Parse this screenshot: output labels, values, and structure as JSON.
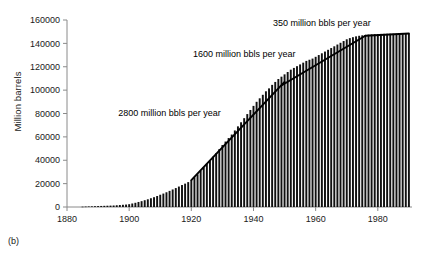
{
  "figure": {
    "caption": "(b)",
    "ylabel": "Million barrels",
    "xlabel": ""
  },
  "chart_data": {
    "type": "bar",
    "title": "",
    "subtitle": "",
    "xlabel": "",
    "ylabel": "Million barrels",
    "xlim": [
      1880,
      1991
    ],
    "ylim": [
      0,
      160000
    ],
    "grid": false,
    "legend": "none",
    "xticks": [
      1880,
      1900,
      1920,
      1940,
      1960,
      1980
    ],
    "xtick_labels": [
      "1880",
      "1900",
      "1920",
      "1940",
      "1960",
      "1980"
    ],
    "yticks": [
      0,
      20000,
      40000,
      60000,
      80000,
      100000,
      120000,
      140000,
      160000
    ],
    "ytick_labels": [
      "0",
      "20000",
      "40000",
      "60000",
      "80000",
      "100000",
      "120000",
      "140000",
      "160000"
    ],
    "x": [
      1885,
      1886,
      1887,
      1888,
      1889,
      1890,
      1891,
      1892,
      1893,
      1894,
      1895,
      1896,
      1897,
      1898,
      1899,
      1900,
      1901,
      1902,
      1903,
      1904,
      1905,
      1906,
      1907,
      1908,
      1909,
      1910,
      1911,
      1912,
      1913,
      1914,
      1915,
      1916,
      1917,
      1918,
      1919,
      1920,
      1921,
      1922,
      1923,
      1924,
      1925,
      1926,
      1927,
      1928,
      1929,
      1930,
      1931,
      1932,
      1933,
      1934,
      1935,
      1936,
      1937,
      1938,
      1939,
      1940,
      1941,
      1942,
      1943,
      1944,
      1945,
      1946,
      1947,
      1948,
      1949,
      1950,
      1951,
      1952,
      1953,
      1954,
      1955,
      1956,
      1957,
      1958,
      1959,
      1960,
      1961,
      1962,
      1963,
      1964,
      1965,
      1966,
      1967,
      1968,
      1969,
      1970,
      1971,
      1972,
      1973,
      1974,
      1975,
      1976,
      1977,
      1978,
      1979,
      1980,
      1981,
      1982,
      1983,
      1984,
      1985,
      1986,
      1987,
      1988,
      1989,
      1990
    ],
    "values": [
      300,
      400,
      500,
      600,
      700,
      800,
      900,
      1000,
      1100,
      1200,
      1300,
      1500,
      1700,
      1900,
      2100,
      2400,
      3000,
      3600,
      4300,
      5000,
      5800,
      6600,
      7500,
      8400,
      9400,
      10500,
      11500,
      12600,
      13800,
      15000,
      16200,
      17500,
      18800,
      20000,
      21300,
      23000,
      25500,
      28000,
      31000,
      34000,
      37000,
      40000,
      43000,
      46000,
      49500,
      53000,
      56000,
      59000,
      62000,
      65500,
      69000,
      72500,
      76000,
      79500,
      83000,
      86500,
      90000,
      93000,
      96000,
      99000,
      101500,
      104500,
      107000,
      109500,
      111500,
      113500,
      115500,
      117500,
      119000,
      120500,
      122000,
      123500,
      125000,
      126000,
      127000,
      128500,
      130000,
      131500,
      133000,
      134500,
      136000,
      137500,
      139000,
      140500,
      142000,
      143500,
      144500,
      145300,
      146000,
      146500,
      146900,
      147200,
      147500,
      147700,
      147900,
      148000,
      148100,
      148150,
      148200,
      148250,
      148300,
      148330,
      148360,
      148390,
      148410,
      148430
    ],
    "trend_lines": [
      {
        "label": "2800 million bbls per year",
        "rate": 2800,
        "unit": "million bbls per year",
        "x_start": 1920,
        "y_start": 23000,
        "x_end": 1950,
        "y_end": 107000
      },
      {
        "label": "1600 million bbls per year",
        "rate": 1600,
        "unit": "million bbls per year",
        "x_start": 1949,
        "y_start": 104000,
        "x_end": 1976,
        "y_end": 146500
      },
      {
        "label": "350 million bbls per year",
        "rate": 350,
        "unit": "million bbls per year",
        "x_start": 1976,
        "y_start": 146500,
        "x_end": 1990,
        "y_end": 148400
      }
    ],
    "annotations": [
      {
        "text": "2800 million bbls per year",
        "x": 1913,
        "y": 78000
      },
      {
        "text": "1600 million bbls per year",
        "x": 1937,
        "y": 128000
      },
      {
        "text": "350 million bbls per year",
        "x": 1962,
        "y": 155000
      }
    ],
    "bar_color": "#111111",
    "line_color": "#000000",
    "axis_color": "#808080"
  }
}
